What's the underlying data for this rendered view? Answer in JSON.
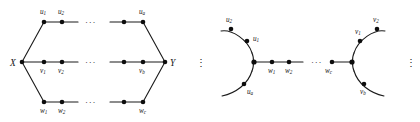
{
  "figure": {
    "caption": "",
    "background_color": "#ffffff",
    "ink_color": "#141414",
    "node_color": "#0d0d0d"
  },
  "left_graph": {
    "name": "theta-graph-X-Y",
    "endpoints": {
      "left": "X",
      "right": "Y"
    },
    "paths": [
      {
        "name": "upper-path-u",
        "first_label": "u",
        "first_sub": "1",
        "second_label": "u",
        "second_sub": "2",
        "last_label": "u",
        "last_sub": "a",
        "ellipsis": "···",
        "labels": [
          "u₁",
          "u₂",
          "uₐ"
        ]
      },
      {
        "name": "middle-path-v",
        "first_label": "v",
        "first_sub": "1",
        "second_label": "v",
        "second_sub": "2",
        "last_label": "v",
        "last_sub": "b",
        "ellipsis": "···",
        "labels": [
          "v₁",
          "v₂",
          "v_b"
        ]
      },
      {
        "name": "lower-path-w",
        "first_label": "w",
        "first_sub": "1",
        "second_label": "w",
        "second_sub": "2",
        "last_label": "w",
        "last_sub": "c",
        "ellipsis": "···",
        "labels": [
          "w₁",
          "w₂",
          "w_c"
        ]
      }
    ]
  },
  "separator_left": {
    "name": "vertical-ellipsis-middle",
    "glyph": "⋮"
  },
  "right_graph": {
    "name": "chain-of-cycles",
    "left_cluster": {
      "arc_upper_label": "u",
      "arc_upper_sub": "2",
      "arc_inner_label": "u",
      "arc_inner_sub": "1",
      "arc_lower_label": "u",
      "arc_lower_sub": "a",
      "path_first_label": "w",
      "path_first_sub": "1",
      "path_second_label": "w",
      "path_second_sub": "2"
    },
    "ellipsis": "···",
    "right_cluster": {
      "path_last_label": "w",
      "path_last_sub": "c",
      "arc_inner_label": "v",
      "arc_inner_sub": "1",
      "arc_upper_label": "v",
      "arc_upper_sub": "2",
      "arc_lower_label": "v",
      "arc_lower_sub": "b"
    }
  },
  "separator_right": {
    "name": "vertical-ellipsis-right",
    "glyph": "⋮"
  }
}
